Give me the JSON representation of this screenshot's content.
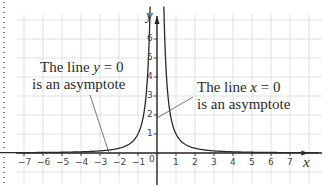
{
  "chart_data": {
    "type": "line",
    "title": "",
    "function": "y = 1/x^2",
    "xlabel": "x",
    "ylabel": "y",
    "xlim": [
      -7.5,
      8.5
    ],
    "ylim": [
      -1.5,
      7
    ],
    "grid": true,
    "x_ticks": [
      -7,
      -6,
      -5,
      -4,
      -3,
      -2,
      -1,
      1,
      2,
      3,
      4,
      5,
      6,
      7
    ],
    "y_ticks": [
      1,
      2,
      3,
      4,
      5,
      6
    ],
    "origin_label": "0",
    "series": [
      {
        "name": "y = 1/x^2 (left branch)",
        "x": [
          -7,
          -6,
          -5,
          -4,
          -3,
          -2,
          -1.5,
          -1,
          -0.75,
          -0.5,
          -0.4
        ],
        "y": [
          0.02,
          0.028,
          0.04,
          0.0625,
          0.111,
          0.25,
          0.444,
          1,
          1.778,
          4,
          6.25
        ]
      },
      {
        "name": "y = 1/x^2 (right branch)",
        "x": [
          0.4,
          0.5,
          0.75,
          1,
          1.5,
          2,
          3,
          4,
          5,
          6,
          7
        ],
        "y": [
          6.25,
          4,
          1.778,
          1,
          0.444,
          0.25,
          0.111,
          0.0625,
          0.04,
          0.028,
          0.02
        ]
      }
    ],
    "annotations": [
      {
        "text_line1_prefix": "The line ",
        "var": "y",
        "text_line1_suffix": " = 0",
        "text_line2": "is an asymptote",
        "points_to": [
          -2.6,
          0
        ]
      },
      {
        "text_line1_prefix": "The line ",
        "var": "x",
        "text_line1_suffix": " = 0",
        "text_line2": "is an asymptote",
        "points_to": [
          0,
          1.9
        ]
      }
    ]
  },
  "colors": {
    "grid": "#d9d9d9",
    "axis": "#222222",
    "curve": "#2a2a2a",
    "pointer": "#555555",
    "text": "#2b2b2b"
  }
}
